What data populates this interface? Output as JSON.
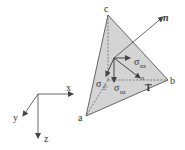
{
  "diagram": {
    "type": "stress tetrahedron (Cauchy tetrahedron)",
    "colors": {
      "face_fill": "#d4d4d4",
      "line": "#444444",
      "background": "#ffffff"
    },
    "vertices": {
      "a": "a",
      "b": "b",
      "c": "c"
    },
    "normal_label": "n",
    "traction_label": "T",
    "traction_superscript": "n",
    "stress_components": {
      "nx": {
        "symbol": "σ",
        "subscript": "nx"
      },
      "ny": {
        "symbol": "σ",
        "subscript": "ny"
      },
      "nz": {
        "symbol": "σ",
        "subscript": "nz"
      }
    },
    "axes": {
      "x": "x",
      "y": "y",
      "z": "z"
    }
  }
}
